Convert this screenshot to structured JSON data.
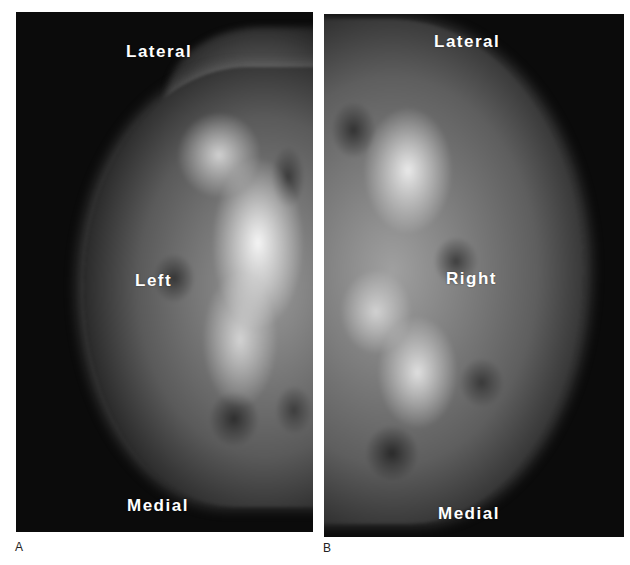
{
  "figure": {
    "panels": [
      {
        "id": "A",
        "letter": "A",
        "side_label": "Left",
        "top_label": "Lateral",
        "bottom_label": "Medial"
      },
      {
        "id": "B",
        "letter": "B",
        "side_label": "Right",
        "top_label": "Lateral",
        "bottom_label": "Medial"
      }
    ],
    "colors": {
      "background": "#ffffff",
      "film": "#0b0b0b",
      "label_text": "#ffffff",
      "panel_letter": "#222222"
    }
  }
}
